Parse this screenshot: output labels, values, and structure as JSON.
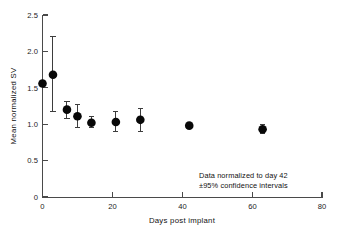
{
  "figure": {
    "background_color": "#ffffff",
    "ink_color": "#111111",
    "marker_color": "#080808",
    "axis_color": "#4a4a4a"
  },
  "chart_data": {
    "type": "scatter",
    "title": "",
    "xlabel": "Days post implant",
    "ylabel": "Mean normalized SV",
    "xlim": [
      0,
      80
    ],
    "ylim": [
      0,
      2.5
    ],
    "xticks": [
      0,
      20,
      40,
      60,
      80
    ],
    "xtick_labels": [
      "0",
      "20",
      "40",
      "60",
      "80"
    ],
    "yticks": [
      0,
      0.5,
      1.0,
      1.5,
      2.0,
      2.5
    ],
    "ytick_labels": [
      "0",
      "0.5",
      "1.0",
      "1.5",
      "2.0",
      "2.5"
    ],
    "grid": false,
    "legend": null,
    "error_bar_type": "95% confidence interval",
    "x": [
      0,
      3,
      7,
      10,
      14,
      21,
      28,
      42,
      63
    ],
    "y": [
      1.56,
      1.68,
      1.2,
      1.11,
      1.02,
      1.03,
      1.06,
      0.98,
      0.93
    ],
    "y_err_low": [
      1.56,
      1.18,
      1.08,
      0.96,
      0.96,
      0.9,
      0.9,
      0.98,
      0.87
    ],
    "y_err_high": [
      1.56,
      2.2,
      1.31,
      1.27,
      1.1,
      1.17,
      1.22,
      0.98,
      1.0
    ],
    "points": [
      {
        "day": 0,
        "value": 1.56,
        "ci_low": 1.56,
        "ci_high": 1.56
      },
      {
        "day": 3,
        "value": 1.68,
        "ci_low": 1.18,
        "ci_high": 2.2
      },
      {
        "day": 7,
        "value": 1.2,
        "ci_low": 1.08,
        "ci_high": 1.31
      },
      {
        "day": 10,
        "value": 1.11,
        "ci_low": 0.96,
        "ci_high": 1.27
      },
      {
        "day": 14,
        "value": 1.02,
        "ci_low": 0.96,
        "ci_high": 1.1
      },
      {
        "day": 21,
        "value": 1.03,
        "ci_low": 0.9,
        "ci_high": 1.17
      },
      {
        "day": 28,
        "value": 1.06,
        "ci_low": 0.9,
        "ci_high": 1.22
      },
      {
        "day": 42,
        "value": 0.98,
        "ci_low": 0.98,
        "ci_high": 0.98
      },
      {
        "day": 63,
        "value": 0.93,
        "ci_low": 0.87,
        "ci_high": 1.0
      }
    ],
    "annotations": [
      "Data normalized to day 42",
      "±95% confidence intervals"
    ]
  }
}
